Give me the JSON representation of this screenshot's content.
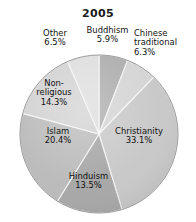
{
  "chart_data": {
    "type": "pie",
    "title": "2005",
    "xlabel": "",
    "ylabel": "",
    "legend": "none",
    "grid": false,
    "start_angle_deg": 0,
    "direction": "clockwise",
    "units": "percent",
    "categories": [
      "Buddhism",
      "Chinese traditional",
      "Christianity",
      "Hinduism",
      "Islam",
      "Non-religious",
      "Other"
    ],
    "values": [
      5.9,
      6.3,
      33.1,
      13.5,
      20.4,
      14.3,
      6.5
    ],
    "slices": [
      {
        "name": "Buddhism",
        "label": "Buddhism\n5.9%",
        "value": 5.9,
        "color": "#a9a9a9"
      },
      {
        "name": "Chinese traditional",
        "label": "Chinese\ntraditional\n6.3%",
        "value": 6.3,
        "color": "#d2d2d2"
      },
      {
        "name": "Christianity",
        "label": "Christianity\n33.1%",
        "value": 33.1,
        "color": "#c6c6c6"
      },
      {
        "name": "Hinduism",
        "label": "Hinduism\n13.5%",
        "value": 13.5,
        "color": "#a3a3a3"
      },
      {
        "name": "Islam",
        "label": "Islam\n20.4%",
        "value": 20.4,
        "color": "#b8b8b8"
      },
      {
        "name": "Non-religious",
        "label": "Non-\nreligious\n14.3%",
        "value": 14.3,
        "color": "#d0d0d0"
      },
      {
        "name": "Other",
        "label": "Other\n6.5%",
        "value": 6.5,
        "color": "#dcdcdc"
      }
    ]
  },
  "colors": {
    "background": "#ffffff",
    "title_text": "#1a1a1a",
    "label_text": "#111111",
    "slice_outline": "#f4f4f4",
    "pie_edge": "#8e8e8e"
  }
}
